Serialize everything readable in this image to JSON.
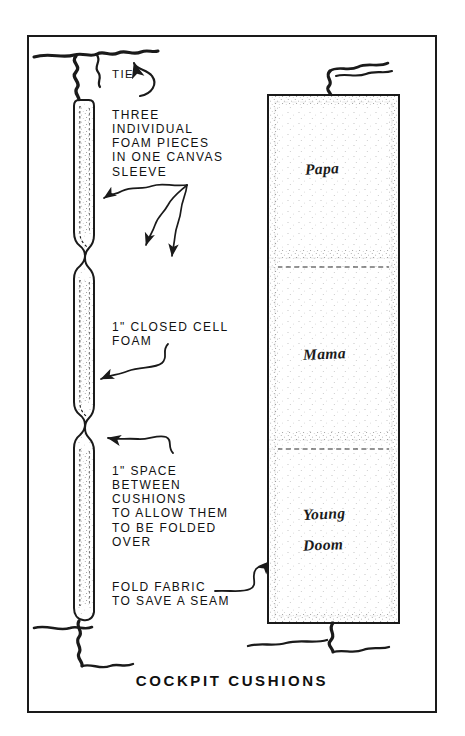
{
  "sheet": {
    "title": "COCKPIT CUSHIONS",
    "ink_color": "#1a1a1a",
    "paper_color": "#ffffff",
    "frame_border_color": "#1a1a1a"
  },
  "annotations": {
    "tie": "TIE",
    "three_foam_pieces": "THREE\nINDIVIDUAL\nFOAM PIECES\nIN ONE CANVAS\nSLEEVE",
    "closed_cell_foam": "1\" CLOSED CELL\nFOAM",
    "space_between": "1\" SPACE\nBETWEEN\nCUSHIONS\nTO ALLOW THEM\nTO BE FOLDED\nOVER",
    "fold_fabric": "FOLD FABRIC\nTO SAVE A SEAM"
  },
  "cushion_panel": {
    "sections": [
      {
        "label": "Papa"
      },
      {
        "label": "Mama"
      },
      {
        "label_line1": "Young",
        "label_line2": "Doom"
      }
    ]
  }
}
